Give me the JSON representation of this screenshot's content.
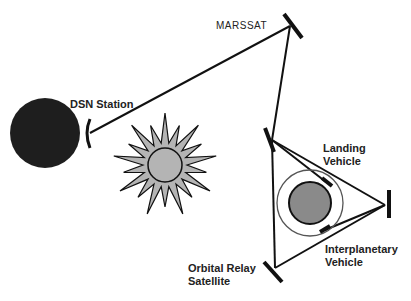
{
  "labels": {
    "marssat": "MARSSAT",
    "dsn_station": "DSN Station",
    "landing_vehicle_1": "Landing",
    "landing_vehicle_2": "Vehicle",
    "interplanetary_1": "Interplanetary",
    "interplanetary_2": "Vehicle",
    "orbital_relay_1": "Orbital Relay",
    "orbital_relay_2": "Satellite"
  },
  "colors": {
    "earth": "#1e1e1e",
    "mars": "#8a8a8a",
    "sun": "#b4b4b4",
    "line": "#111111"
  }
}
